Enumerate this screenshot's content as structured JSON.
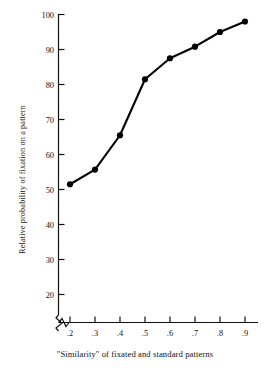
{
  "chart_data": {
    "type": "line",
    "title": "",
    "subtitle": "",
    "xlabel": "\"Similarity\" of fixated and standard patterns",
    "ylabel": "Relative probability of fixation on a pattern",
    "x": [
      0.2,
      0.3,
      0.4,
      0.5,
      0.6,
      0.7,
      0.8,
      0.9
    ],
    "values": [
      51.5,
      55.7,
      65.5,
      81.5,
      87.5,
      90.8,
      95.0,
      98.0
    ],
    "xtick_labels": [
      ".2",
      ".3",
      ".4",
      ".5",
      ".6",
      ".7",
      ".8",
      ".9"
    ],
    "ytick_labels": [
      "20",
      "30",
      "40",
      "50",
      "60",
      "70",
      "80",
      "90",
      "100"
    ],
    "ytick_values": [
      20,
      30,
      40,
      50,
      60,
      70,
      80,
      90,
      100
    ],
    "xlim": [
      0.155,
      0.975
    ],
    "ylim": [
      14,
      100
    ],
    "grid": false,
    "legend": null,
    "axis_break_y": true,
    "marker": "filled-circle",
    "line_color": "#000000",
    "marker_color": "#000000",
    "background_color": "#ffffff"
  }
}
